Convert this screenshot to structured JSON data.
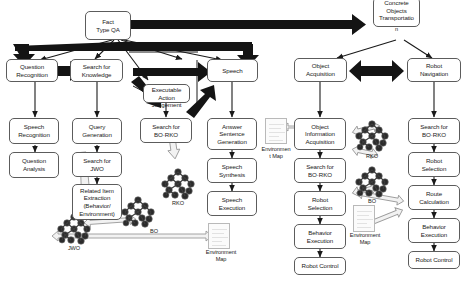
{
  "diagram": {
    "colors": {
      "box_border": "#5c5c5c",
      "box_fill": "#ffffff",
      "thick_arrow": "#141414",
      "thin_arrow": "#1a1a1a",
      "open_arrow_stroke": "#9a9a9a",
      "open_arrow_fill": "#f2f2f2",
      "tree_dark": "#2b2b2b",
      "tree_mid": "#6e6e6e",
      "envmap_border": "#b9b9b9"
    },
    "nodes": [
      {
        "id": "fact-type-qa",
        "label": "Fact\nType QA"
      },
      {
        "id": "concrete-objects-transportation",
        "label": "Concrete\nObjects\nTransportatio\nn"
      },
      {
        "id": "question-recognition",
        "label": "Question\nRecognition"
      },
      {
        "id": "search-for-knowledge",
        "label": "Search for\nKnowledge"
      },
      {
        "id": "executable-action-judgement",
        "label": "Executable\nAction\nJudgement"
      },
      {
        "id": "speech",
        "label": "Speech"
      },
      {
        "id": "object-acquisition",
        "label": "Object\nAcquisition"
      },
      {
        "id": "robot-navigation",
        "label": "Robot\nNavigation"
      },
      {
        "id": "speech-recognition",
        "label": "Speech\nRecognition"
      },
      {
        "id": "query-generation",
        "label": "Query\nGeneration"
      },
      {
        "id": "search-for-bo-rko-1",
        "label": "Search for\nBO·RKO"
      },
      {
        "id": "answer-sentence-generation",
        "label": "Answer\nSentence\nGeneration"
      },
      {
        "id": "object-information-acquisition",
        "label": "Object\nInformation\nAcquisition"
      },
      {
        "id": "search-for-bo-rko-2",
        "label": "Search for\nBO·RKO"
      },
      {
        "id": "question-analysis",
        "label": "Question\nAnalysis"
      },
      {
        "id": "search-for-jwo",
        "label": "Search for\nJWO"
      },
      {
        "id": "speech-synthesis",
        "label": "Speech\nSynthesis"
      },
      {
        "id": "search-for-bo-rko-3",
        "label": "Search for\nBO·RKO"
      },
      {
        "id": "robot-selection-1",
        "label": "Robot\nSelection"
      },
      {
        "id": "related-item-extraction",
        "label": "Related Item\nExtraction\n(Behavior/\nEnvironment)"
      },
      {
        "id": "speech-execution",
        "label": "Speech\nExecution"
      },
      {
        "id": "robot-selection-2",
        "label": "Robot\nSelection"
      },
      {
        "id": "route-calculation",
        "label": "Route\nCalculation"
      },
      {
        "id": "behavior-execution-1",
        "label": "Behavior\nExecution"
      },
      {
        "id": "behavior-execution-2",
        "label": "Behavior\nExecution"
      },
      {
        "id": "robot-control-1",
        "label": "Robot Control"
      },
      {
        "id": "robot-control-2",
        "label": "Robot Control"
      }
    ],
    "node_labels": {
      "fact_type_qa": "Fact\nType QA",
      "concrete_objects_transportation": "Concrete\nObjects\nTransportatio",
      "concrete_objects_transportation_overflow": "n",
      "question_recognition": "Question\nRecognition",
      "search_for_knowledge": "Search for\nKnowledge",
      "executable_action_judgement": "Executable\nAction\nJudgement",
      "speech": "Speech",
      "object_acquisition": "Object\nAcquisition",
      "robot_navigation": "Robot\nNavigation",
      "speech_recognition": "Speech\nRecognition",
      "query_generation": "Query\nGeneration",
      "search_for_bo_rko_1": "Search for\nBO·RKO",
      "answer_sentence_generation": "Answer\nSentence\nGeneration",
      "object_information_acquisition": "Object\nInformation\nAcquisition",
      "search_for_bo_rko_2": "Search for\nBO·RKO",
      "question_analysis": "Question\nAnalysis",
      "search_for_jwo": "Search for\nJWO",
      "speech_synthesis": "Speech\nSynthesis",
      "search_for_bo_rko_3": "Search for\nBO·RKO",
      "robot_selection_1": "Robot\nSelection",
      "related_item_extraction": "Related Item\nExtraction\n(Behavior/\nEnvironment)",
      "speech_execution": "Speech\nExecution",
      "robot_selection_2": "Robot\nSelection",
      "route_calculation": "Route\nCalculation",
      "behavior_execution_1": "Behavior\nExecution",
      "behavior_execution_2": "Behavior\nExecution",
      "robot_control_1": "Robot Control",
      "robot_control_2": "Robot Control"
    },
    "object_labels": {
      "rko_mid": "RKO",
      "bo_mid": "BO",
      "jwo": "JWO",
      "bo_left": "BO",
      "environment_map_left": "Environment\nMap",
      "environment_map_center": "Environmen\nt Map",
      "environment_map_right": "Environment\nMap",
      "rko_right": "RKO",
      "bo_right": "BO"
    }
  }
}
